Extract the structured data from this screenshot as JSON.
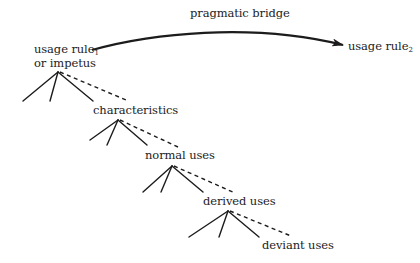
{
  "diagram": {
    "bridge": {
      "label": "pragmatic bridge",
      "source": {
        "text": "usage rule",
        "subscript": "1",
        "line2": "or impetus"
      },
      "target": {
        "text": "usage rule",
        "subscript": "2"
      }
    },
    "levels": [
      {
        "label": "characteristics"
      },
      {
        "label": "normal uses"
      },
      {
        "label": "derived uses"
      },
      {
        "label": "deviant uses"
      }
    ]
  }
}
